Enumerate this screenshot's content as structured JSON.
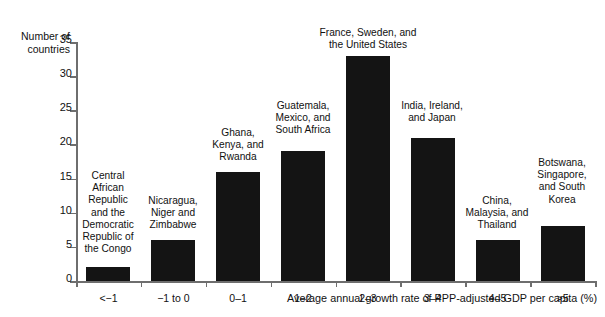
{
  "chart_data": {
    "type": "bar",
    "title": "",
    "subtitle": "",
    "xlabel": "Average annual growth rate of PPP-adjusted GDP per capita (%)",
    "ylabel": "Number of\ncountries",
    "ylim": [
      0,
      35
    ],
    "ytick_values": [
      0,
      5,
      10,
      15,
      20,
      25,
      30,
      35
    ],
    "ytick_labels": [
      "0",
      "5",
      "10",
      "15",
      "20",
      "25",
      "30",
      "35"
    ],
    "grid": false,
    "legend": "none",
    "categories": [
      "<−1",
      "−1 to 0",
      "0–1",
      "1–2",
      "2–3",
      "3–4",
      "4–5",
      ">5"
    ],
    "values": [
      2,
      6,
      16,
      19,
      33,
      21,
      6,
      8
    ],
    "bar_color": "#141414",
    "axis_color": "#6e6e6e",
    "annotations": [
      "Central\nAfrican\nRepublic\nand the\nDemocratic\nRepublic of\nthe Congo",
      "Nicaragua,\nNiger and\nZimbabwe",
      "Ghana,\nKenya, and\nRwanda",
      "Guatemala,\nMexico, and\nSouth Africa",
      "France, Sweden, and\nthe United States",
      "India, Ireland,\nand Japan",
      "China,\nMalaysia, and\nThailand",
      "Botswana,\nSingapore,\nand South\nKorea"
    ]
  }
}
